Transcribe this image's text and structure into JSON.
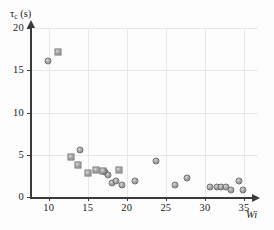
{
  "chart_data": {
    "type": "scatter",
    "title": "",
    "xlabel": "Wi",
    "ylabel": "τc (s)",
    "ylabel_symbol": "τ",
    "ylabel_subscript": "c",
    "ylabel_unit": "(s)",
    "xlim": [
      7.6,
      36.8
    ],
    "ylim": [
      0,
      20
    ],
    "xticks": [
      10,
      15,
      20,
      25,
      30,
      35
    ],
    "yticks": [
      0,
      5,
      10,
      15,
      20
    ],
    "xtick_labels": [
      "10",
      "15",
      "20",
      "25",
      "30",
      "35"
    ],
    "ytick_labels": [
      "0",
      "5",
      "10",
      "15",
      "20"
    ],
    "grid": true,
    "legend": "none",
    "marker_colors": {
      "fill_light": "#d8d8d8",
      "fill_mid": "#a9a9a9",
      "fill_dark": "#7b7b7b",
      "edge": "#6d6d6d"
    },
    "axis_color": "#3a3a3a",
    "grid_color": "#e8e8e8",
    "background": "#fdfdfd",
    "series": [
      {
        "name": "circles",
        "marker": "circle",
        "points": [
          {
            "x": 9.95,
            "y": 16.1
          },
          {
            "x": 14.0,
            "y": 5.55
          },
          {
            "x": 17.2,
            "y": 2.95
          },
          {
            "x": 17.6,
            "y": 2.55
          },
          {
            "x": 18.1,
            "y": 1.6
          },
          {
            "x": 18.6,
            "y": 1.95
          },
          {
            "x": 19.4,
            "y": 1.45
          },
          {
            "x": 21.1,
            "y": 1.95
          },
          {
            "x": 23.7,
            "y": 4.25
          },
          {
            "x": 26.2,
            "y": 1.4
          },
          {
            "x": 27.7,
            "y": 2.25
          },
          {
            "x": 30.7,
            "y": 1.2
          },
          {
            "x": 31.5,
            "y": 1.2
          },
          {
            "x": 32.1,
            "y": 1.2
          },
          {
            "x": 32.7,
            "y": 1.15
          },
          {
            "x": 33.3,
            "y": 0.85
          },
          {
            "x": 34.4,
            "y": 1.95
          },
          {
            "x": 34.9,
            "y": 0.8
          }
        ]
      },
      {
        "name": "squares",
        "marker": "square",
        "points": [
          {
            "x": 11.2,
            "y": 17.15
          },
          {
            "x": 12.8,
            "y": 4.7
          },
          {
            "x": 13.7,
            "y": 3.75
          },
          {
            "x": 15.0,
            "y": 2.8
          },
          {
            "x": 16.0,
            "y": 3.2
          },
          {
            "x": 17.0,
            "y": 3.05
          },
          {
            "x": 19.0,
            "y": 3.15
          }
        ]
      }
    ]
  }
}
